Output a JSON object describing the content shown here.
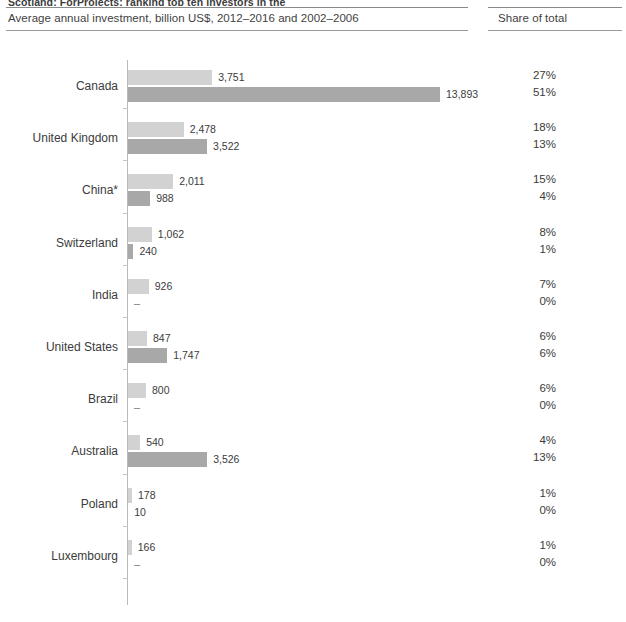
{
  "header": {
    "cut_title": "Scotland: ForProjects: ranking top ten investors in the",
    "subtitle": "Average annual investment, billion US$, 2012–2016 and 2002–2006",
    "share_header": "Share of total"
  },
  "legend": {
    "series_recent_label": "2012–2016",
    "series_older_label": "2002–2006",
    "color_recent": "#d2d2d2",
    "color_older": "#a8a8a8"
  },
  "chart_data": {
    "type": "bar",
    "orientation": "horizontal",
    "title": "Average annual investment, billion US$, 2012–2016 and 2002–2006",
    "xlabel": "",
    "ylabel": "",
    "grid": false,
    "legend_position": "none",
    "xlim": [
      0,
      14000
    ],
    "categories": [
      "Canada",
      "United Kingdom",
      "China*",
      "Switzerland",
      "India",
      "United States",
      "Brazil",
      "Australia",
      "Poland",
      "Luxembourg"
    ],
    "series": [
      {
        "name": "2012–2016",
        "values": [
          3751,
          2478,
          2011,
          1062,
          926,
          847,
          800,
          540,
          178,
          166
        ],
        "labels": [
          "3,751",
          "2,478",
          "2,011",
          "1,062",
          "926",
          "847",
          "800",
          "540",
          "178",
          "166"
        ],
        "share": [
          "27%",
          "18%",
          "15%",
          "8%",
          "7%",
          "6%",
          "6%",
          "4%",
          "1%",
          "1%"
        ]
      },
      {
        "name": "2002–2006",
        "values": [
          13893,
          3522,
          988,
          240,
          0,
          1747,
          0,
          3526,
          10,
          0
        ],
        "labels": [
          "13,893",
          "3,522",
          "988",
          "240",
          "–",
          "1,747",
          "–",
          "3,526",
          "10",
          "–"
        ],
        "share": [
          "51%",
          "13%",
          "4%",
          "1%",
          "0%",
          "6%",
          "0%",
          "13%",
          "0%",
          "0%"
        ]
      }
    ],
    "footnote_marker": "*"
  }
}
